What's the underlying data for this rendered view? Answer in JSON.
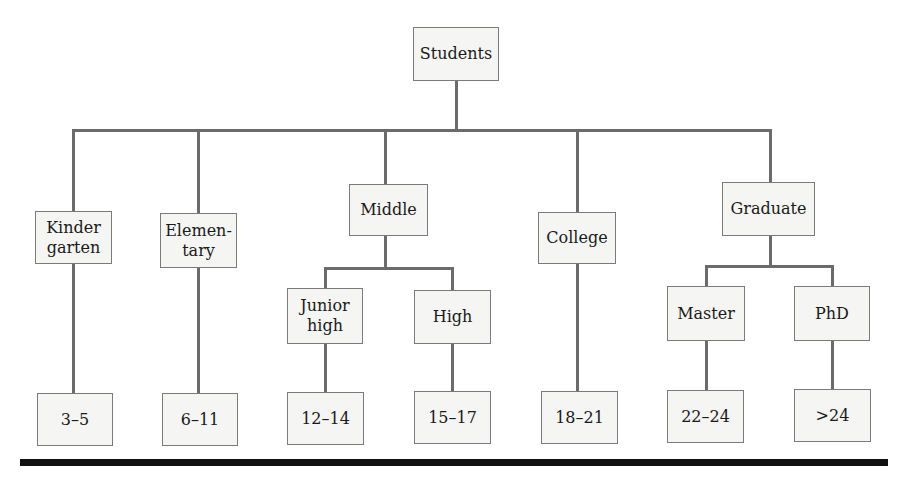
{
  "diagram": {
    "type": "tree",
    "root": {
      "label": "Students"
    },
    "categories": [
      {
        "label": "Kinder\ngarten",
        "children": [],
        "age": "3–5"
      },
      {
        "label": "Elemen-\ntary",
        "children": [],
        "age": "6–11"
      },
      {
        "label": "Middle",
        "children": [
          {
            "label": "Junior\nhigh",
            "age": "12–14"
          },
          {
            "label": "High",
            "age": "15–17"
          }
        ]
      },
      {
        "label": "College",
        "children": [],
        "age": "18–21"
      },
      {
        "label": "Graduate",
        "children": [
          {
            "label": "Master",
            "age": "22–24"
          },
          {
            "label": "PhD",
            "age": ">24"
          }
        ]
      }
    ]
  },
  "labels": {
    "root": "Students",
    "kindergarten": "Kinder\ngarten",
    "elementary": "Elemen-\ntary",
    "middle": "Middle",
    "junior_high": "Junior\nhigh",
    "high": "High",
    "college": "College",
    "graduate": "Graduate",
    "master": "Master",
    "phd": "PhD"
  },
  "ages": {
    "kindergarten": "3–5",
    "elementary": "6–11",
    "junior_high": "12–14",
    "high": "15–17",
    "college": "18–21",
    "master": "22–24",
    "phd": ">24"
  },
  "colors": {
    "box_fill": "#f5f5f3",
    "box_border": "#7a7a7a",
    "connector": "#6b6b6b",
    "rule": "#111111"
  }
}
